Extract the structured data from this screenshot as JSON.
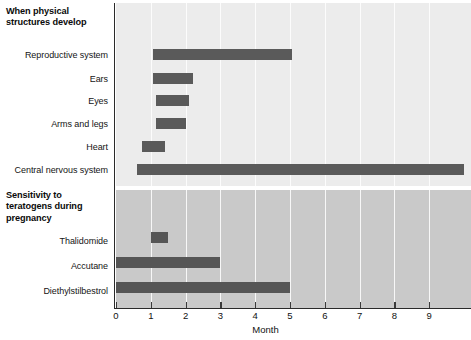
{
  "figure": {
    "sections": [
      {
        "id": "when-physical-structures-develop",
        "title": "When physical\nstructures develop",
        "rows": [
          {
            "label": "Reproductive system",
            "start": 1.05,
            "end": 5.05
          },
          {
            "label": "Ears",
            "start": 1.05,
            "end": 2.2
          },
          {
            "label": "Eyes",
            "start": 1.15,
            "end": 2.1
          },
          {
            "label": "Arms and legs",
            "start": 1.15,
            "end": 2.0
          },
          {
            "label": "Heart",
            "start": 0.75,
            "end": 1.4
          },
          {
            "label": "Central nervous system",
            "start": 0.6,
            "end": 10.0
          }
        ]
      },
      {
        "id": "sensitivity-to-teratogens",
        "title": "Sensitivity to\nteratogens during\npregnancy",
        "rows": [
          {
            "label": "Thalidomide",
            "start": 1.0,
            "end": 1.5
          },
          {
            "label": "Accutane",
            "start": 0.0,
            "end": 3.0
          },
          {
            "label": "Diethylstilbestrol",
            "start": 0.0,
            "end": 5.0
          }
        ]
      }
    ],
    "xaxis": {
      "title": "Month",
      "ticks": [
        0,
        1,
        2,
        3,
        4,
        5,
        6,
        7,
        8,
        9
      ],
      "min": 0,
      "max": 10.2
    },
    "colors": {
      "bar": "#5a5a5a",
      "panel_top_bg": "#ececec",
      "panel_bottom_bg": "#c9c9c9",
      "axis": "#2a2a2a",
      "gridline": "#ffffff"
    }
  },
  "chart_data": {
    "type": "bar",
    "orientation": "horizontal",
    "title": "",
    "xlabel": "Month",
    "ylabel": "",
    "xlim": [
      0,
      10.2
    ],
    "grid": true,
    "legend": "none",
    "note": "Horizontal range (Gantt-style) chart of prenatal development periods, split into two stacked panels.",
    "panels": [
      {
        "name": "When physical structures develop",
        "background": "#ececec",
        "categories": [
          "Reproductive system",
          "Ears",
          "Eyes",
          "Arms and legs",
          "Heart",
          "Central nervous system"
        ],
        "ranges": [
          [
            1.05,
            5.05
          ],
          [
            1.05,
            2.2
          ],
          [
            1.15,
            2.1
          ],
          [
            1.15,
            2.0
          ],
          [
            0.75,
            1.4
          ],
          [
            0.6,
            10.0
          ]
        ]
      },
      {
        "name": "Sensitivity to teratogens during pregnancy",
        "background": "#c9c9c9",
        "categories": [
          "Thalidomide",
          "Accutane",
          "Diethylstilbestrol"
        ],
        "ranges": [
          [
            1.0,
            1.5
          ],
          [
            0.0,
            3.0
          ],
          [
            0.0,
            5.0
          ]
        ]
      }
    ],
    "xticks": [
      0,
      1,
      2,
      3,
      4,
      5,
      6,
      7,
      8,
      9
    ]
  }
}
